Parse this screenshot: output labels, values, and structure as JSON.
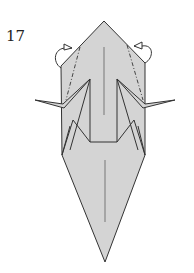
{
  "diagram": {
    "step_number": "17",
    "type": "origami-fold-diagram",
    "colors": {
      "paper": "#d4d4d4",
      "outline": "#333333",
      "background": "#ffffff"
    },
    "annotations": [
      {
        "kind": "fold-behind-arrow",
        "side": "left"
      },
      {
        "kind": "fold-behind-arrow",
        "side": "right"
      },
      {
        "kind": "mountain-fold-line",
        "side": "left"
      },
      {
        "kind": "mountain-fold-line",
        "side": "right"
      }
    ]
  }
}
